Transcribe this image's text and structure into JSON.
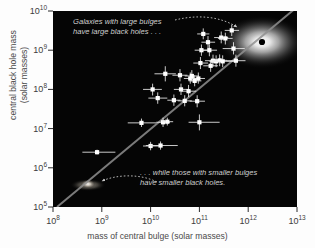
{
  "chart_data": {
    "type": "scatter",
    "title": "",
    "xlabel": "mass of central bulge (solar masses)",
    "ylabel_line1": "central black hole mass",
    "ylabel_line2": "(solar masses)",
    "xlim": [
      100000000.0,
      10000000000000.0
    ],
    "ylim": [
      100000.0,
      10000000000.0
    ],
    "xscale": "log",
    "yscale": "log",
    "grid": false,
    "legend": "none",
    "xticks": [
      "10^8",
      "10^9",
      "10^10",
      "10^11",
      "10^12",
      "10^13"
    ],
    "yticks": [
      "10^5",
      "10^6",
      "10^7",
      "10^8",
      "10^9",
      "10^10"
    ],
    "xtick_labels": [
      {
        "base": "10",
        "exp": "8"
      },
      {
        "base": "10",
        "exp": "9"
      },
      {
        "base": "10",
        "exp": "10"
      },
      {
        "base": "10",
        "exp": "11"
      },
      {
        "base": "10",
        "exp": "12"
      },
      {
        "base": "10",
        "exp": "13"
      }
    ],
    "ytick_labels": [
      {
        "base": "10",
        "exp": "10"
      },
      {
        "base": "10",
        "exp": "9"
      },
      {
        "base": "10",
        "exp": "8"
      },
      {
        "base": "10",
        "exp": "7"
      },
      {
        "base": "10",
        "exp": "6"
      },
      {
        "base": "10",
        "exp": "5"
      }
    ],
    "fit_line": {
      "description": "best-fit correlation line",
      "x_start": 110000000.0,
      "y_start": 100000.0,
      "x_end": 8000000000000.0,
      "y_end": 10000000000.0,
      "color": "#8f8f8f"
    },
    "points": [
      {
        "x": 800000000.0,
        "y": 2500000.0,
        "xerr_lo": 400000000.0,
        "xerr_hi": 1900000000.0,
        "yerr_lo": 2200000.0,
        "yerr_hi": 2900000.0
      },
      {
        "x": 6500000000.0,
        "y": 14000000.0,
        "xerr_lo": 3400000000.0,
        "xerr_hi": 13000000000.0,
        "yerr_lo": 11000000.0,
        "yerr_hi": 18000000.0
      },
      {
        "x": 10000000000.0,
        "y": 3600000.0,
        "xerr_lo": 7000000000.0,
        "xerr_hi": 15000000000.0,
        "yerr_lo": 2800000.0,
        "yerr_hi": 4600000.0
      },
      {
        "x": 16000000000.0,
        "y": 3700000.0,
        "xerr_lo": 8000000000.0,
        "xerr_hi": 36000000000.0,
        "yerr_lo": 2900000.0,
        "yerr_hi": 4700000.0
      },
      {
        "x": 18000000000.0,
        "y": 14500000.0,
        "xerr_lo": 13000000000.0,
        "xerr_hi": 25000000000.0,
        "yerr_lo": 11000000.0,
        "yerr_hi": 19000000.0
      },
      {
        "x": 22000000000.0,
        "y": 15000000.0,
        "xerr_lo": 17000000000.0,
        "xerr_hi": 29000000000.0,
        "yerr_lo": 12000000.0,
        "yerr_hi": 19000000.0
      },
      {
        "x": 20000000000.0,
        "y": 250000000.0,
        "xerr_lo": 12000000000.0,
        "xerr_hi": 33000000000.0,
        "yerr_lo": 160000000.0,
        "yerr_hi": 390000000.0
      },
      {
        "x": 14000000000.0,
        "y": 60000000.0,
        "xerr_lo": 9000000000.0,
        "xerr_hi": 22000000000.0,
        "yerr_lo": 43000000.0,
        "yerr_hi": 84000000.0
      },
      {
        "x": 11000000000.0,
        "y": 100000000.0,
        "xerr_lo": 7000000000.0,
        "xerr_hi": 17000000000.0,
        "yerr_lo": 70000000.0,
        "yerr_hi": 140000000.0
      },
      {
        "x": 30000000000.0,
        "y": 53000000.0,
        "xerr_lo": 22000000000.0,
        "xerr_hi": 41000000000.0,
        "yerr_lo": 38000000.0,
        "yerr_hi": 74000000.0
      },
      {
        "x": 40000000000.0,
        "y": 230000000.0,
        "xerr_lo": 28000000000.0,
        "xerr_hi": 57000000000.0,
        "yerr_lo": 160000000.0,
        "yerr_hi": 330000000.0
      },
      {
        "x": 42000000000.0,
        "y": 100000000.0,
        "xerr_lo": 30000000000.0,
        "xerr_hi": 59000000000.0,
        "yerr_lo": 72000000.0,
        "yerr_hi": 140000000.0
      },
      {
        "x": 50000000000.0,
        "y": 51000000.0,
        "xerr_lo": 36000000000.0,
        "xerr_hi": 70000000000.0,
        "yerr_lo": 37000000.0,
        "yerr_hi": 71000000.0
      },
      {
        "x": 60000000000.0,
        "y": 90000000.0,
        "xerr_lo": 42000000000.0,
        "xerr_hi": 86000000000.0,
        "yerr_lo": 64000000.0,
        "yerr_hi": 130000000.0
      },
      {
        "x": 65000000000.0,
        "y": 190000000.0,
        "xerr_lo": 48000000000.0,
        "xerr_hi": 88000000000.0,
        "yerr_lo": 140000000.0,
        "yerr_hi": 270000000.0
      },
      {
        "x": 70000000000.0,
        "y": 220000000.0,
        "xerr_lo": 50000000000.0,
        "xerr_hi": 98000000000.0,
        "yerr_lo": 160000000.0,
        "yerr_hi": 310000000.0
      },
      {
        "x": 80000000000.0,
        "y": 165000000.0,
        "xerr_lo": 60000000000.0,
        "xerr_hi": 110000000000.0,
        "yerr_lo": 120000000.0,
        "yerr_hi": 230000000.0
      },
      {
        "x": 90000000000.0,
        "y": 50000000.0,
        "xerr_lo": 63000000000.0,
        "xerr_hi": 130000000000.0,
        "yerr_lo": 35000000.0,
        "yerr_hi": 71000000.0
      },
      {
        "x": 100000000000.0,
        "y": 14500000.0,
        "xerr_lo": 60000000000.0,
        "xerr_hi": 260000000000.0,
        "yerr_lo": 9000000.0,
        "yerr_hi": 23000000.0
      },
      {
        "x": 95000000000.0,
        "y": 190000000.0,
        "xerr_lo": 70000000000.0,
        "xerr_hi": 130000000000.0,
        "yerr_lo": 140000000.0,
        "yerr_hi": 270000000.0
      },
      {
        "x": 105000000000.0,
        "y": 470000000.0,
        "xerr_lo": 75000000000.0,
        "xerr_hi": 150000000000.0,
        "yerr_lo": 330000000.0,
        "yerr_hi": 670000000.0
      },
      {
        "x": 110000000000.0,
        "y": 1000000000.0,
        "xerr_lo": 80000000000.0,
        "xerr_hi": 150000000000.0,
        "yerr_lo": 720000000.0,
        "yerr_hi": 1400000000.0
      },
      {
        "x": 120000000000.0,
        "y": 2600000000.0,
        "xerr_lo": 90000000000.0,
        "xerr_hi": 160000000000.0,
        "yerr_lo": 1900000000.0,
        "yerr_hi": 3600000000.0
      },
      {
        "x": 150000000000.0,
        "y": 1600000000.0,
        "xerr_lo": 110000000000.0,
        "xerr_hi": 210000000000.0,
        "yerr_lo": 1100000000.0,
        "yerr_hi": 2300000000.0
      },
      {
        "x": 160000000000.0,
        "y": 1000000000.0,
        "xerr_lo": 110000000000.0,
        "xerr_hi": 230000000000.0,
        "yerr_lo": 700000000.0,
        "yerr_hi": 1400000000.0
      },
      {
        "x": 170000000000.0,
        "y": 400000000.0,
        "xerr_lo": 120000000000.0,
        "xerr_hi": 240000000000.0,
        "yerr_lo": 280000000.0,
        "yerr_hi": 570000000.0
      },
      {
        "x": 190000000000.0,
        "y": 540000000.0,
        "xerr_lo": 130000000000.0,
        "xerr_hi": 270000000000.0,
        "yerr_lo": 380000000.0,
        "yerr_hi": 770000000.0
      },
      {
        "x": 220000000000.0,
        "y": 520000000.0,
        "xerr_lo": 160000000000.0,
        "xerr_hi": 310000000000.0,
        "yerr_lo": 370000000.0,
        "yerr_hi": 740000000.0
      },
      {
        "x": 260000000000.0,
        "y": 550000000.0,
        "xerr_lo": 180000000000.0,
        "xerr_hi": 370000000000.0,
        "yerr_lo": 390000000.0,
        "yerr_hi": 780000000.0
      },
      {
        "x": 300000000000.0,
        "y": 520000000.0,
        "xerr_lo": 170000000000.0,
        "xerr_hi": 530000000000.0,
        "yerr_lo": 370000000.0,
        "yerr_hi": 740000000.0
      },
      {
        "x": 280000000000.0,
        "y": 2100000000.0,
        "xerr_lo": 200000000000.0,
        "xerr_hi": 390000000000.0,
        "yerr_lo": 1500000000.0,
        "yerr_hi": 3000000000.0
      },
      {
        "x": 340000000000.0,
        "y": 2000000000.0,
        "xerr_lo": 240000000000.0,
        "xerr_hi": 480000000000.0,
        "yerr_lo": 1400000000.0,
        "yerr_hi": 2800000000.0
      },
      {
        "x": 460000000000.0,
        "y": 3200000000.0,
        "xerr_lo": 330000000000.0,
        "xerr_hi": 650000000000.0,
        "yerr_lo": 2300000000.0,
        "yerr_hi": 4500000000.0
      },
      {
        "x": 500000000000.0,
        "y": 1100000000.0,
        "xerr_lo": 300000000000.0,
        "xerr_hi": 850000000000.0,
        "yerr_lo": 780000000.0,
        "yerr_hi": 1600000000.0
      },
      {
        "x": 560000000000.0,
        "y": 540000000.0,
        "xerr_lo": 360000000000.0,
        "xerr_hi": 880000000000.0,
        "yerr_lo": 380000000.0,
        "yerr_hi": 770000000.0
      }
    ],
    "annotations": [
      {
        "name": "large-bulge-note",
        "line1": "Galaxies with large bulges",
        "line2": "have large black holes . . .",
        "points_to": "large elliptical galaxy at upper right"
      },
      {
        "name": "small-bulge-note",
        "line1": ". . . while those with smaller bulges",
        "line2": "have smaller black holes.",
        "points_to": "small galaxy at lower left"
      }
    ],
    "illustrations": [
      {
        "name": "large-elliptical-galaxy",
        "x": 1600000000000.0,
        "y": 2000000000.0,
        "has_black_hole_dot": true
      },
      {
        "name": "small-spiral-galaxy",
        "x": 500000000.0,
        "y": 380000.0,
        "has_black_hole_dot": false
      }
    ]
  },
  "axes": {
    "x": {
      "label": "mass of central bulge (solar masses)",
      "ticks": [
        {
          "base": "10",
          "exp": "8"
        },
        {
          "base": "10",
          "exp": "9"
        },
        {
          "base": "10",
          "exp": "10"
        },
        {
          "base": "10",
          "exp": "11"
        },
        {
          "base": "10",
          "exp": "12"
        },
        {
          "base": "10",
          "exp": "13"
        }
      ]
    },
    "y": {
      "label_line1": "central black hole mass",
      "label_line2": "(solar masses)",
      "ticks": [
        {
          "base": "10",
          "exp": "10"
        },
        {
          "base": "10",
          "exp": "9"
        },
        {
          "base": "10",
          "exp": "8"
        },
        {
          "base": "10",
          "exp": "7"
        },
        {
          "base": "10",
          "exp": "6"
        },
        {
          "base": "10",
          "exp": "5"
        }
      ]
    }
  },
  "annotations": {
    "top_line1": "Galaxies with large bulges",
    "top_line2": "have large black holes . . .",
    "bottom_line1": ". . . while those with smaller bulges",
    "bottom_line2": "have smaller black holes."
  },
  "colors": {
    "plot_background": "#050505",
    "page_background": "#fdfdfd",
    "point": "#ffffff",
    "fit_line": "#8f8f8f",
    "annotation_text": "#cfcfcf",
    "axis_text": "#4a4a4a"
  }
}
